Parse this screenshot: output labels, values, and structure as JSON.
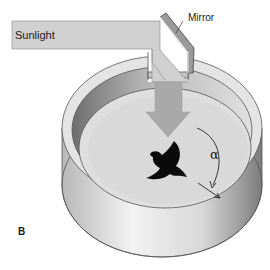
{
  "figure": {
    "panel_label": "B",
    "labels": {
      "sunlight": "Sunlight",
      "mirror": "Mirror",
      "angle": "α"
    },
    "elements": [
      "sunlight-beam",
      "mirror",
      "reflected-light-arrow",
      "circular-cage",
      "bird-silhouette",
      "angle-arrow"
    ],
    "colors": {
      "beam": "#cfcfcf",
      "arrow": "#a8a8a8",
      "cage_rim": "#e2e2e2",
      "cage_inner_wall": "#8f8f8f",
      "floor": "#dcdcdc",
      "bird": "#0a0a0a",
      "outline": "#555555"
    }
  }
}
